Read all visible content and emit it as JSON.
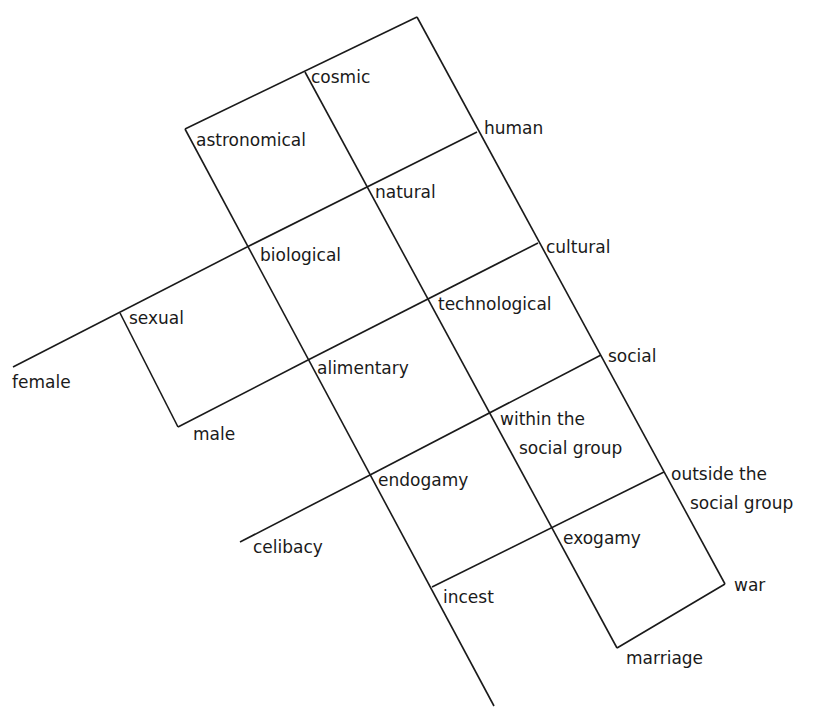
{
  "diagram": {
    "type": "culinary-triangle-style grid",
    "labels": {
      "cosmic": "cosmic",
      "astronomical": "astronomical",
      "human": "human",
      "natural": "natural",
      "biological": "biological",
      "cultural": "cultural",
      "sexual": "sexual",
      "technological": "technological",
      "female": "female",
      "alimentary": "alimentary",
      "social": "social",
      "male": "male",
      "within_line1": "within the",
      "within_line2": "social group",
      "outside_line1": "outside the",
      "outside_line2": "social group",
      "endogamy": "endogamy",
      "celibacy": "celibacy",
      "exogamy": "exogamy",
      "incest": "incest",
      "war": "war",
      "marriage": "marriage"
    },
    "line_color": "#1a1a1a"
  }
}
